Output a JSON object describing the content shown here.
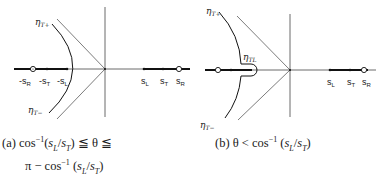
{
  "panels": [
    {
      "id": "a",
      "contour_labels": {
        "upper": "η",
        "upper_sub": "T+",
        "lower": "η",
        "lower_sub": "T−"
      },
      "left_points": [
        {
          "label": "-s",
          "sub": "R",
          "type": "open-circle"
        },
        {
          "label": "-s",
          "sub": "T",
          "type": "dot"
        },
        {
          "label": "-s",
          "sub": "L",
          "type": "dot"
        }
      ],
      "right_points": [
        {
          "label": "s",
          "sub": "L",
          "type": "dot"
        },
        {
          "label": "s",
          "sub": "T",
          "type": "dot"
        },
        {
          "label": "s",
          "sub": "R",
          "type": "open-circle"
        }
      ],
      "caption_line1": "(a) cos⁻¹(sL/sT) ≦ θ ≦",
      "caption_line2": "π − cos⁻¹ (sL/sT)"
    },
    {
      "id": "b",
      "contour_labels": {
        "upper": "η",
        "upper_sub": "T+",
        "lower": "η",
        "lower_sub": "T−",
        "loop": "η",
        "loop_sub": "TL"
      },
      "right_points": [
        {
          "label": "s",
          "sub": "L",
          "type": "dot"
        },
        {
          "label": "s",
          "sub": "T",
          "type": "dot"
        },
        {
          "label": "s",
          "sub": "R",
          "type": "open-circle"
        }
      ],
      "caption": "(b) θ < cos⁻¹ (sL/sT)"
    }
  ],
  "captions": {
    "a_prefix": "(a)",
    "a_cos": "cos",
    "a_sup": "−1",
    "a_args": "(s",
    "a_l": "L",
    "a_slash": "/s",
    "a_t": "T",
    "a_close": ")",
    "a_rel": " ≦ θ ≦",
    "a_pi": "π − cos",
    "b_prefix": "(b)",
    "b_theta": "θ < cos"
  },
  "colors": {
    "ink": "#1a1a1a",
    "background": "#ffffff"
  }
}
